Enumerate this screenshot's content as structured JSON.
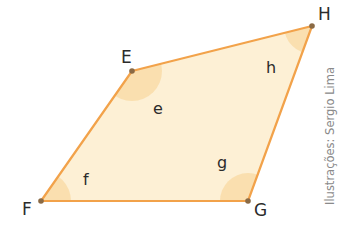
{
  "diagram": {
    "type": "quadrilateral",
    "colors": {
      "fill": "#fdf0d5",
      "stroke": "#f2a24a",
      "angle_fill": "#f9dca8",
      "vertex_dot": "#8a6a45",
      "label": "#2b2b2b",
      "credit": "#8a8a8a"
    },
    "vertices": [
      {
        "name": "E",
        "x": 132,
        "y": 71
      },
      {
        "name": "H",
        "x": 312,
        "y": 26
      },
      {
        "name": "G",
        "x": 248,
        "y": 201
      },
      {
        "name": "F",
        "x": 41,
        "y": 201
      }
    ],
    "vertex_labels": {
      "E": "E",
      "H": "H",
      "G": "G",
      "F": "F"
    },
    "angle_labels": {
      "e": "e",
      "h": "h",
      "g": "g",
      "f": "f"
    },
    "credit": "Ilustrações: Sergio Lima"
  }
}
